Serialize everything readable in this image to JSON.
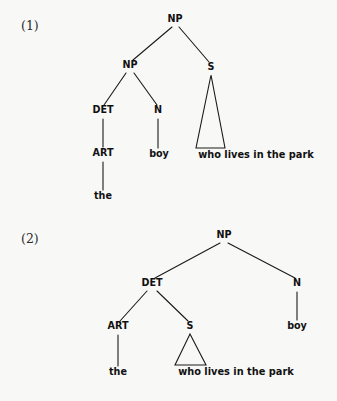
{
  "figure": {
    "background_color": "#f8f8f6",
    "ink_color": "#111111",
    "width": 337,
    "height": 401
  },
  "examples": [
    {
      "number_label": "(1)",
      "number_x": 21,
      "number_y": 30,
      "structure_note": "NP-over-NP adjunction: [NP [NP DET N] S]",
      "nodes": [
        {
          "id": "np_root",
          "label": "NP",
          "kind": "category",
          "x": 175,
          "y": 22
        },
        {
          "id": "np_inner",
          "label": "NP",
          "kind": "category",
          "x": 130,
          "y": 68
        },
        {
          "id": "s_node",
          "label": "S",
          "kind": "category",
          "x": 211,
          "y": 70
        },
        {
          "id": "det",
          "label": "DET",
          "kind": "category",
          "x": 103,
          "y": 113
        },
        {
          "id": "n",
          "label": "N",
          "kind": "category",
          "x": 158,
          "y": 113
        },
        {
          "id": "art",
          "label": "ART",
          "kind": "category",
          "x": 103,
          "y": 156
        },
        {
          "id": "boy",
          "label": "boy",
          "kind": "terminal",
          "x": 159,
          "y": 157
        },
        {
          "id": "the",
          "label": "the",
          "kind": "terminal",
          "x": 103,
          "y": 199
        },
        {
          "id": "clause",
          "label": "who lives in the park",
          "kind": "terminal",
          "x": 256,
          "y": 158
        }
      ],
      "edges": [
        {
          "id": "e1",
          "from": "np_root",
          "to": "np_inner",
          "x1": 172,
          "y1": 27,
          "x2": 133,
          "y2": 60
        },
        {
          "id": "e2",
          "from": "np_root",
          "to": "s_node",
          "x1": 179,
          "y1": 27,
          "x2": 209,
          "y2": 62
        },
        {
          "id": "e3",
          "from": "np_inner",
          "to": "det",
          "x1": 126,
          "y1": 73,
          "x2": 104,
          "y2": 105
        },
        {
          "id": "e4",
          "from": "np_inner",
          "to": "n",
          "x1": 134,
          "y1": 73,
          "x2": 157,
          "y2": 105
        },
        {
          "id": "e5",
          "from": "det",
          "to": "art",
          "x1": 103,
          "y1": 119,
          "x2": 103,
          "y2": 147
        },
        {
          "id": "e6",
          "from": "n",
          "to": "boy",
          "x1": 158,
          "y1": 119,
          "x2": 158,
          "y2": 148
        },
        {
          "id": "e7",
          "from": "art",
          "to": "the",
          "x1": 103,
          "y1": 162,
          "x2": 103,
          "y2": 190
        }
      ],
      "triangles": [
        {
          "id": "t1",
          "over": "who lives in the park",
          "apex_x": 211,
          "apex_y": 75,
          "base_left_x": 196,
          "base_right_x": 225,
          "base_y": 148
        }
      ]
    },
    {
      "number_label": "(2)",
      "number_x": 21,
      "number_y": 243,
      "structure_note": "DET-complement analysis: [NP [DET ART S] N]",
      "nodes": [
        {
          "id": "np_root2",
          "label": "NP",
          "kind": "category",
          "x": 224,
          "y": 238
        },
        {
          "id": "det2",
          "label": "DET",
          "kind": "category",
          "x": 152,
          "y": 286
        },
        {
          "id": "n2",
          "label": "N",
          "kind": "category",
          "x": 297,
          "y": 286
        },
        {
          "id": "art2",
          "label": "ART",
          "kind": "category",
          "x": 118,
          "y": 329
        },
        {
          "id": "s2",
          "label": "S",
          "kind": "category",
          "x": 190,
          "y": 329
        },
        {
          "id": "boy2",
          "label": "boy",
          "kind": "terminal",
          "x": 297,
          "y": 329
        },
        {
          "id": "the2",
          "label": "the",
          "kind": "terminal",
          "x": 118,
          "y": 375
        },
        {
          "id": "clause2",
          "label": "who lives in the park",
          "kind": "terminal",
          "x": 236,
          "y": 375
        }
      ],
      "edges": [
        {
          "id": "f1",
          "from": "np_root2",
          "to": "det2",
          "x1": 220,
          "y1": 243,
          "x2": 155,
          "y2": 278
        },
        {
          "id": "f2",
          "from": "np_root2",
          "to": "n2",
          "x1": 228,
          "y1": 243,
          "x2": 295,
          "y2": 278
        },
        {
          "id": "f3",
          "from": "det2",
          "to": "art2",
          "x1": 147,
          "y1": 291,
          "x2": 120,
          "y2": 321
        },
        {
          "id": "f4",
          "from": "det2",
          "to": "s2",
          "x1": 157,
          "y1": 291,
          "x2": 188,
          "y2": 321
        },
        {
          "id": "f5",
          "from": "n2",
          "to": "boy2",
          "x1": 297,
          "y1": 292,
          "x2": 297,
          "y2": 320
        },
        {
          "id": "f6",
          "from": "art2",
          "to": "the2",
          "x1": 118,
          "y1": 335,
          "x2": 118,
          "y2": 366
        }
      ],
      "triangles": [
        {
          "id": "t2",
          "over": "who lives in the park",
          "apex_x": 190,
          "apex_y": 334,
          "base_left_x": 175,
          "base_right_x": 206,
          "base_y": 365
        }
      ]
    }
  ]
}
